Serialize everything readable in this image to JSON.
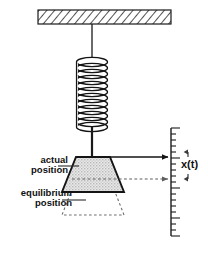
{
  "figure": {
    "type": "physics-schematic",
    "background_color": "#ffffff",
    "line_color": "#1a1a1a",
    "mass_fill_color": "#d8d8d8",
    "hatch_color": "#555555",
    "dashed_color": "#6b6b6b"
  },
  "labels": {
    "actual_position": {
      "line1": "actual",
      "line2": "position"
    },
    "equilibrium_position": {
      "line1": "equilibrium",
      "line2": "position"
    },
    "displacement": "x(t)"
  },
  "components": {
    "ceiling": {
      "name": "hatched-ceiling-support",
      "x": 38,
      "y": 10,
      "width": 133,
      "height": 14
    },
    "hanger_wire": {
      "name": "hanger-wire",
      "x": 92,
      "y_top": 24,
      "y_bottom": 57
    },
    "spring": {
      "name": "coil-spring",
      "center_x": 92,
      "y_top": 57,
      "y_bottom": 130,
      "coils": 13,
      "radius_x": 16,
      "radius_y": 5
    },
    "rod": {
      "name": "connecting-rod",
      "x": 92,
      "y_top": 130,
      "y_bottom": 156
    },
    "mass_actual": {
      "name": "mass-actual-position",
      "top_left_x": 76,
      "top_right_x": 110,
      "bottom_left_x": 62,
      "bottom_right_x": 124,
      "y_top": 156,
      "y_bottom": 192
    },
    "mass_equilibrium": {
      "name": "mass-equilibrium-position",
      "top_left_x": 76,
      "top_right_x": 110,
      "bottom_left_x": 62,
      "bottom_right_x": 124,
      "y_top": 178,
      "y_bottom": 214
    },
    "ruler": {
      "name": "measurement-scale",
      "x": 171,
      "y_top": 128,
      "y_bottom": 236,
      "tick_spacing": 6,
      "minor_tick_length": 5,
      "major_tick_length": 9,
      "major_every": 5
    },
    "arrow_actual": {
      "name": "actual-position-pointer-arrow",
      "x_start": 94,
      "x_end": 170,
      "y": 157,
      "style": "solid"
    },
    "arrow_equilibrium": {
      "name": "equilibrium-position-pointer-arrow",
      "x_start": 74,
      "x_end": 170,
      "y": 179,
      "style": "dashed"
    },
    "displacement_marker": {
      "name": "displacement-extent-marker",
      "x": 186,
      "y_top": 153,
      "y_bottom": 181
    },
    "leader_actual": {
      "name": "actual-position-leader-line",
      "x_start": 60,
      "x_end": 78,
      "y": 166
    },
    "leader_equilibrium": {
      "name": "equilibrium-position-leader-line",
      "x_start": 64,
      "x_end": 82,
      "y": 200
    }
  }
}
